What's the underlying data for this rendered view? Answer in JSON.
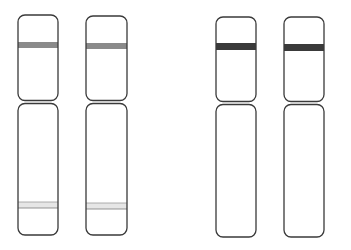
{
  "diagram": {
    "type": "chromosome-pairs",
    "colors": {
      "background": "#ffffff",
      "outline": "#3a3a3a",
      "band_medium": "#8a8a8a",
      "band_dark": "#3a3a3a",
      "band_light": "#e6e6e6"
    },
    "pairs": [
      {
        "name": "pair-left",
        "chromosomes": [
          {
            "x": 18,
            "width": 40,
            "top": 15,
            "centromere": 102,
            "bottom": 235,
            "bands": [
              {
                "y": 42,
                "height": 6,
                "shade": "band_medium"
              },
              {
                "y": 202,
                "height": 6,
                "shade": "band_light"
              }
            ]
          },
          {
            "x": 86,
            "width": 41,
            "top": 16,
            "centromere": 102,
            "bottom": 235,
            "bands": [
              {
                "y": 43,
                "height": 6,
                "shade": "band_medium"
              },
              {
                "y": 203,
                "height": 6,
                "shade": "band_light"
              }
            ]
          }
        ]
      },
      {
        "name": "pair-right",
        "chromosomes": [
          {
            "x": 216,
            "width": 40,
            "top": 17,
            "centromere": 103,
            "bottom": 237,
            "bands": [
              {
                "y": 43,
                "height": 7,
                "shade": "band_dark"
              }
            ]
          },
          {
            "x": 284,
            "width": 40,
            "top": 17,
            "centromere": 103,
            "bottom": 237,
            "bands": [
              {
                "y": 44,
                "height": 7,
                "shade": "band_dark"
              }
            ]
          }
        ]
      }
    ]
  }
}
